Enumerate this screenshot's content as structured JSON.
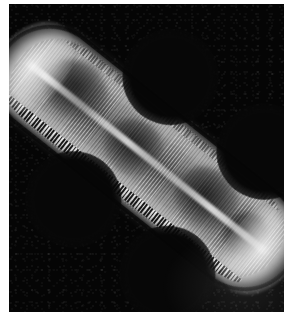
{
  "image": {
    "kind": "scanning-electron-micrograph",
    "subject": "diatom-frustule",
    "caption": "",
    "background_color": "#050505",
    "border_color": "#ffffff",
    "specimen_color": "#9a9a9a",
    "highlight_color": "#ffffff",
    "orientation_degrees": 38.5
  },
  "specimen": {
    "outline": "panduriform valve with two median constrictions and rounded apices",
    "features": [
      {
        "name": "raphe",
        "label": "raphe"
      },
      {
        "name": "transapical-striae",
        "label": "transapical striae"
      },
      {
        "name": "serrated-margin",
        "label": "serrated costae margin"
      },
      {
        "name": "chloroplast-1",
        "label": "chloroplast"
      },
      {
        "name": "chloroplast-2",
        "label": "chloroplast"
      },
      {
        "name": "chloroplast-3",
        "label": "chloroplast"
      },
      {
        "name": "chloroplast-4",
        "label": "chloroplast"
      },
      {
        "name": "apex-left",
        "label": "apex"
      },
      {
        "name": "apex-right",
        "label": "apex"
      }
    ]
  },
  "annotations": {
    "scale_bar_text": "",
    "magnification_text": "",
    "label_text": ""
  }
}
